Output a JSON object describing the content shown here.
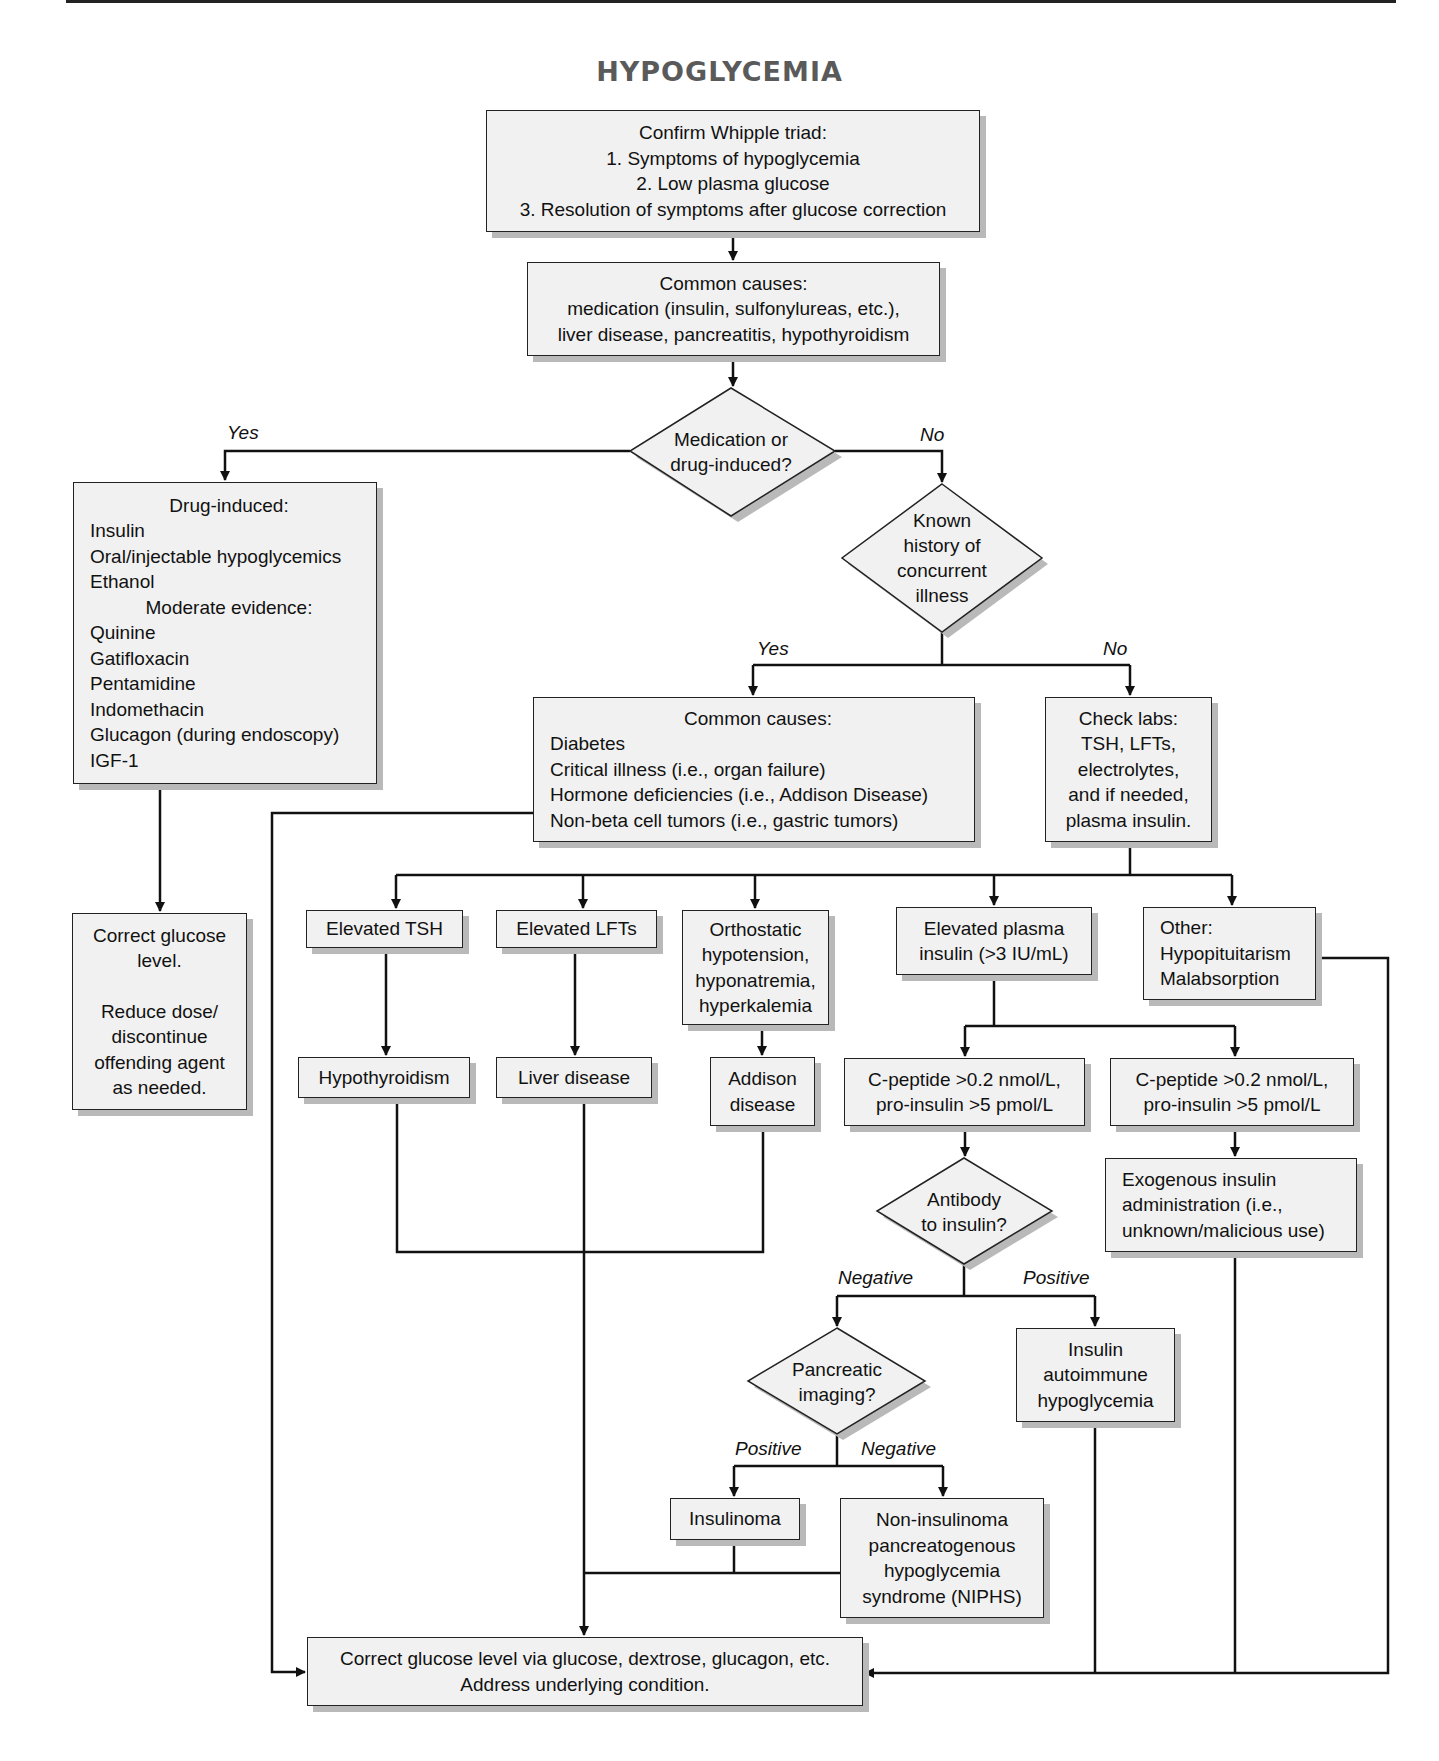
{
  "title": "HYPOGLYCEMIA",
  "nodes": {
    "whipple": {
      "lines": [
        "Confirm Whipple triad:",
        "1. Symptoms of hypoglycemia",
        "2. Low plasma glucose",
        "3. Resolution of symptoms after glucose correction"
      ]
    },
    "common_causes_top": {
      "lines": [
        "Common causes:",
        "medication (insulin, sulfonylureas, etc.),",
        "liver disease, pancreatitis, hypothyroidism"
      ]
    },
    "decision_medication": {
      "lines": [
        "Medication or",
        "drug-induced?"
      ]
    },
    "drug_induced": {
      "heading": "Drug-induced:",
      "items": [
        "Insulin",
        "Oral/injectable hypoglycemics",
        "Ethanol"
      ],
      "subheading": "Moderate evidence:",
      "sub_items": [
        "Quinine",
        "Gatifloxacin",
        "Pentamidine",
        "Indomethacin",
        "Glucagon (during endoscopy)",
        "IGF-1"
      ]
    },
    "decision_history": {
      "lines": [
        "Known",
        "history of",
        "concurrent",
        "illness"
      ]
    },
    "common_causes_mid": {
      "heading": "Common causes:",
      "items": [
        "Diabetes",
        "Critical illness (i.e., organ failure)",
        "Hormone deficiencies (i.e., Addison Disease)",
        "Non-beta cell tumors (i.e., gastric tumors)"
      ]
    },
    "check_labs": {
      "lines": [
        "Check labs:",
        "TSH, LFTs,",
        "electrolytes,",
        "and if needed,",
        "plasma insulin."
      ]
    },
    "correct_glucose_left": {
      "lines": [
        "Correct glucose",
        "level.",
        "",
        "Reduce dose/",
        "discontinue",
        "offending agent",
        "as needed."
      ]
    },
    "elevated_tsh": {
      "lines": [
        "Elevated TSH"
      ]
    },
    "elevated_lfts": {
      "lines": [
        "Elevated LFTs"
      ]
    },
    "orthostatic": {
      "lines": [
        "Orthostatic",
        "hypotension,",
        "hyponatremia,",
        "hyperkalemia"
      ]
    },
    "elevated_insulin": {
      "lines": [
        "Elevated plasma",
        "insulin (>3 IU/mL)"
      ]
    },
    "other": {
      "lines": [
        "Other:",
        "Hypopituitarism",
        "Malabsorption"
      ]
    },
    "hypothyroidism": {
      "lines": [
        "Hypothyroidism"
      ]
    },
    "liver_disease": {
      "lines": [
        "Liver disease"
      ]
    },
    "addison": {
      "lines": [
        "Addison",
        "disease"
      ]
    },
    "cpeptide_a": {
      "lines": [
        "C-peptide >0.2 nmol/L,",
        "pro-insulin >5 pmol/L"
      ]
    },
    "cpeptide_b": {
      "lines": [
        "C-peptide >0.2 nmol/L,",
        "pro-insulin >5 pmol/L"
      ]
    },
    "decision_antibody": {
      "lines": [
        "Antibody",
        "to insulin?"
      ]
    },
    "exogenous": {
      "lines": [
        "Exogenous insulin",
        "administration (i.e.,",
        "unknown/malicious use)"
      ]
    },
    "decision_imaging": {
      "lines": [
        "Pancreatic",
        "imaging?"
      ]
    },
    "insulin_autoimmune": {
      "lines": [
        "Insulin",
        "autoimmune",
        "hypoglycemia"
      ]
    },
    "insulinoma": {
      "lines": [
        "Insulinoma"
      ]
    },
    "niphs": {
      "lines": [
        "Non-insulinoma",
        "pancreatogenous",
        "hypoglycemia",
        "syndrome (NIPHS)"
      ]
    },
    "correct_glucose_final": {
      "lines": [
        "Correct glucose level via glucose, dextrose, glucagon, etc.",
        "Address underlying condition."
      ]
    }
  },
  "edge_labels": {
    "medication_yes": "Yes",
    "medication_no": "No",
    "history_yes": "Yes",
    "history_no": "No",
    "antibody_negative": "Negative",
    "antibody_positive": "Positive",
    "imaging_positive": "Positive",
    "imaging_negative": "Negative"
  },
  "colors": {
    "box_fill": "#f1f1f1",
    "box_border": "#222222",
    "shadow": "#b9b9b9",
    "title": "#5a5a5a",
    "line": "#111111"
  }
}
